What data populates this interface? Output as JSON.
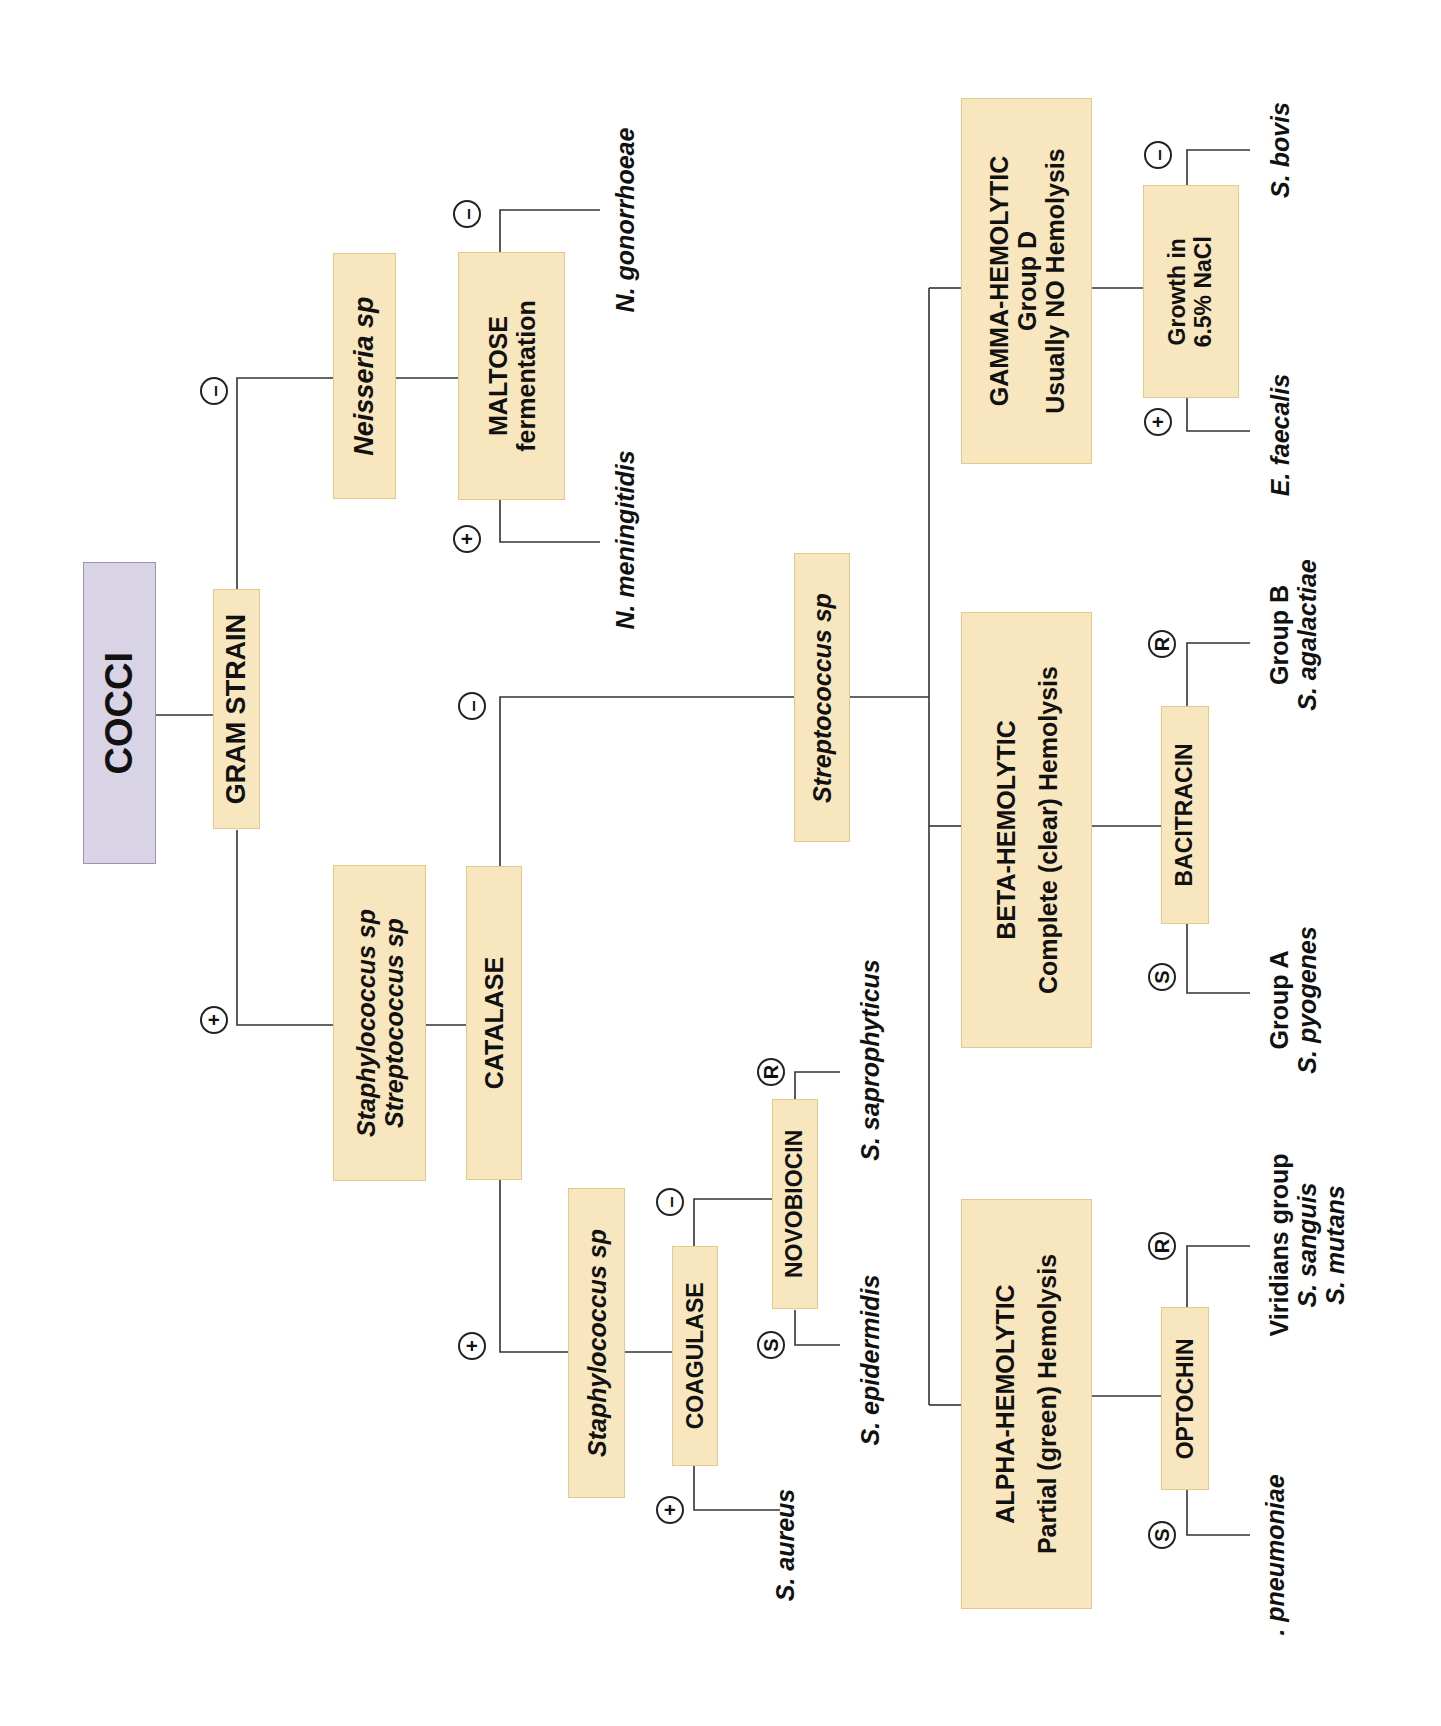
{
  "diagram": {
    "root": "COCCI",
    "gram_stain": "GRAM STRAIN",
    "signs": {
      "plus": "+",
      "minus": "–",
      "sensitive": "S",
      "resistant": "R"
    },
    "gram_negative": {
      "genus": "Neisseria sp",
      "test_line1": "MALTOSE",
      "test_line2": "fermentation",
      "positive_result": "N. meningitidis",
      "negative_result": "N. gonorrhoeae"
    },
    "gram_positive": {
      "genus_line1": "Staphylococcus sp",
      "genus_line2": "Streptococcus sp",
      "test": "CATALASE",
      "catalase_positive": {
        "genus": "Staphylococcus sp",
        "test": "COAGULASE",
        "coagulase_positive": "S. aureus",
        "coagulase_negative": {
          "test": "NOVOBIOCIN",
          "sensitive": "S. epidermidis",
          "resistant": "S. saprophyticus"
        }
      },
      "catalase_negative": {
        "genus": "Streptococcus sp",
        "alpha": {
          "title": "ALPHA-HEMOLYTIC",
          "subtitle": "Partial (green) Hemolysis",
          "test": "OPTOCHIN",
          "sensitive": ". pneumoniae",
          "resistant_line1": "Viridians group",
          "resistant_line2": "S. sanguis",
          "resistant_line3": "S. mutans"
        },
        "beta": {
          "title": "BETA-HEMOLYTIC",
          "subtitle": "Complete (clear) Hemolysis",
          "test": "BACITRACIN",
          "sensitive_line1": "Group A",
          "sensitive_line2": "S. pyogenes",
          "resistant_line1": "Group B",
          "resistant_line2": "S. agalactiae"
        },
        "gamma": {
          "title": "GAMMA-HEMOLYTIC",
          "subtitle": "Group D",
          "subtitle2": "Usually NO Hemolysis",
          "test_line1": "Growth in",
          "test_line2": "6.5% NaCl",
          "positive_result": "E. faecalis",
          "negative_result": "S. bovis"
        }
      }
    }
  },
  "colors": {
    "box_fill": "#f7e6be",
    "box_border": "#e3c98a",
    "root_fill": "#d9d3e6",
    "root_border": "#9e93b6",
    "line": "#333333"
  }
}
